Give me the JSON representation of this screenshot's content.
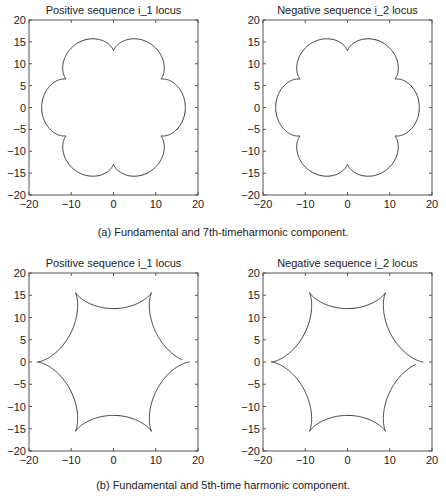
{
  "captions": {
    "a": "(a) Fundamental and 7th-timeharmonic component.",
    "b": "(b) Fundamental and 5th-time harmonic component."
  },
  "chart_data": [
    {
      "type": "line",
      "panel": "a-left",
      "title": "Positive sequence i_1 locus",
      "xlim": [
        -20,
        20
      ],
      "ylim": [
        -20,
        20
      ],
      "xticks": [
        -20,
        -10,
        0,
        10,
        20
      ],
      "yticks": [
        -20,
        -15,
        -10,
        -5,
        0,
        5,
        10,
        15,
        20
      ],
      "curve": {
        "fund": 15,
        "harm_amp": 2,
        "harm_order": 7,
        "theta_start_deg": -12,
        "theta_end_deg": 350
      },
      "box": [
        29,
        20,
        198,
        195
      ]
    },
    {
      "type": "line",
      "panel": "a-right",
      "title": "Negative sequence i_2 locus",
      "xlim": [
        -20,
        20
      ],
      "ylim": [
        -20,
        20
      ],
      "xticks": [
        -20,
        -10,
        0,
        10,
        20
      ],
      "yticks": [
        -20,
        -15,
        -10,
        -5,
        0,
        5,
        10,
        15,
        20
      ],
      "curve": {
        "fund": 15,
        "harm_amp": 2,
        "harm_order": 7,
        "theta_start_deg": 12,
        "theta_end_deg": -350
      },
      "box": [
        263,
        20,
        432,
        195
      ]
    },
    {
      "type": "line",
      "panel": "b-left",
      "title": "Positive sequence i_1 locus",
      "xlim": [
        -20,
        20
      ],
      "ylim": [
        -20,
        20
      ],
      "xticks": [
        -20,
        -10,
        0,
        10,
        20
      ],
      "yticks": [
        -20,
        -15,
        -10,
        -5,
        0,
        5,
        10,
        15,
        20
      ],
      "curve": {
        "fund": 15,
        "harm_amp": 3,
        "harm_order": -5,
        "theta_start_deg": 0,
        "theta_end_deg": -348
      },
      "box": [
        29,
        273,
        198,
        451
      ]
    },
    {
      "type": "line",
      "panel": "b-right",
      "title": "Negative sequence i_2 locus",
      "xlim": [
        -20,
        20
      ],
      "ylim": [
        -20,
        20
      ],
      "xticks": [
        -20,
        -10,
        0,
        10,
        20
      ],
      "yticks": [
        -20,
        -15,
        -10,
        -5,
        0,
        5,
        10,
        15,
        20
      ],
      "curve": {
        "fund": 15,
        "harm_amp": 3,
        "harm_order": -5,
        "theta_start_deg": 0,
        "theta_end_deg": 348
      },
      "box": [
        263,
        273,
        432,
        451
      ]
    }
  ]
}
